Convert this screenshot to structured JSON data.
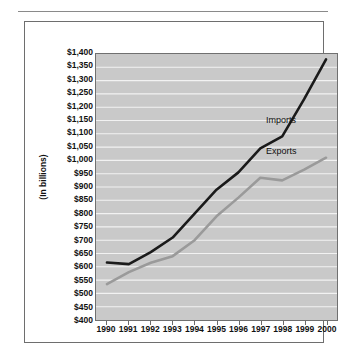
{
  "chart_data": {
    "type": "line",
    "title": "",
    "subtitle": "",
    "xlabel": "",
    "ylabel": "(In billions)",
    "x": [
      1990,
      1991,
      1992,
      1993,
      1994,
      1995,
      1996,
      1997,
      1998,
      1999,
      2000
    ],
    "categories": [
      "1990",
      "1991",
      "1992",
      "1993",
      "1994",
      "1995",
      "1996",
      "1997",
      "1998",
      "1999",
      "2000"
    ],
    "series": [
      {
        "name": "Imports",
        "color": "#1a1a1a",
        "values": [
          616,
          610,
          655,
          710,
          800,
          890,
          955,
          1045,
          1090,
          1230,
          1380
        ]
      },
      {
        "name": "Exports",
        "color": "#9a9a9a",
        "values": [
          535,
          580,
          615,
          640,
          700,
          790,
          860,
          935,
          925,
          965,
          1010
        ]
      }
    ],
    "ylim": [
      400,
      1400
    ],
    "ytick_step": 50,
    "ytick_labels": [
      "$1,400",
      "$1,350",
      "$1,300",
      "$1,250",
      "$1,200",
      "$1,150",
      "$1,100",
      "$1,050",
      "$1,000",
      "$950",
      "$900",
      "$850",
      "$800",
      "$750",
      "$700",
      "$650",
      "$600",
      "$550",
      "$500",
      "$450",
      "$400"
    ],
    "ytick_values": [
      1400,
      1350,
      1300,
      1250,
      1200,
      1150,
      1100,
      1050,
      1000,
      950,
      900,
      850,
      800,
      750,
      700,
      650,
      600,
      550,
      500,
      450,
      400
    ],
    "grid": true,
    "grid_color": "#f2f2f2",
    "plot_background": "#c9c9c9",
    "legend_position": "in-plot-labels",
    "annotations": [
      {
        "text": "Imports",
        "x": 1997.1,
        "y": 1150
      },
      {
        "text": "Exports",
        "x": 1997.1,
        "y": 1035
      }
    ]
  }
}
